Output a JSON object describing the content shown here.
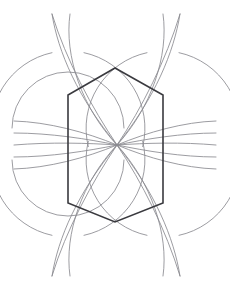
{
  "canvas": {
    "width": 230,
    "height": 290,
    "background": "#ffffff",
    "title": "Hexagon with radiating circular arcs"
  },
  "palette": {
    "hexagon_stroke": "#3a3a3f",
    "arc_stroke": "#8a8a90",
    "arc_stroke_dark": "#76767c",
    "background": "#ffffff"
  },
  "strokes": {
    "hexagon_width": 1.6,
    "arc_width": 0.85
  },
  "geometry": {
    "center": {
      "x": 117,
      "y": 145
    },
    "radius": 66,
    "hexagon": {
      "label": "hexagon",
      "points": "115,68 163,95 163,203 115,222 68,203 68,95",
      "vertices": [
        {
          "name": "top-apex",
          "x": 115,
          "y": 68
        },
        {
          "name": "upper-right",
          "x": 163,
          "y": 95
        },
        {
          "name": "lower-right",
          "x": 163,
          "y": 203
        },
        {
          "name": "bottom-apex",
          "x": 115,
          "y": 222
        },
        {
          "name": "lower-left",
          "x": 68,
          "y": 203
        },
        {
          "name": "upper-left",
          "x": 68,
          "y": 95
        }
      ]
    },
    "nodes": [
      {
        "name": "node-left-upper",
        "x": 68,
        "y": 128
      },
      {
        "name": "node-left-lower",
        "x": 68,
        "y": 160
      },
      {
        "name": "node-right-upper",
        "x": 163,
        "y": 128
      },
      {
        "name": "node-right-lower",
        "x": 163,
        "y": 160
      },
      {
        "name": "node-center",
        "x": 117,
        "y": 145
      }
    ],
    "arc_centers": [
      {
        "name": "arc-center-left-upper",
        "x": 68,
        "y": 128,
        "r": 66
      },
      {
        "name": "arc-center-left-lower",
        "x": 68,
        "y": 160,
        "r": 66
      },
      {
        "name": "arc-center-right-upper",
        "x": 163,
        "y": 128,
        "r": 66
      },
      {
        "name": "arc-center-right-lower",
        "x": 163,
        "y": 160,
        "r": 66
      },
      {
        "name": "arc-center-top",
        "x": 117,
        "y": 78,
        "r": 66
      },
      {
        "name": "arc-center-bottom",
        "x": 117,
        "y": 212,
        "r": 66
      },
      {
        "name": "arc-center-far-left",
        "x": 20,
        "y": 145,
        "r": 98
      },
      {
        "name": "arc-center-far-right",
        "x": 214,
        "y": 145,
        "r": 98
      }
    ],
    "arc_paths": [
      {
        "name": "arc-top-left-long",
        "d": "M 52,14 C 58,52 78,98 117,145"
      },
      {
        "name": "arc-top-right-long",
        "d": "M 180,14 C 174,52 155,98 117,145"
      },
      {
        "name": "arc-bottom-left-long",
        "d": "M 52,276 C 58,238 78,192 117,145"
      },
      {
        "name": "arc-bottom-right-long",
        "d": "M 180,276 C 174,238 155,192 117,145"
      },
      {
        "name": "arc-top-inner-left",
        "d": "M 70,14 C 64,56 82,108 117,145"
      },
      {
        "name": "arc-top-inner-right",
        "d": "M 163,14 C 169,56 151,108 117,145"
      },
      {
        "name": "arc-bottom-inner-left",
        "d": "M 70,276 C 64,234 82,182 117,145"
      },
      {
        "name": "arc-bottom-inner-right",
        "d": "M 163,276 C 169,234 151,182 117,145"
      },
      {
        "name": "arc-left-upper-fan",
        "d": "M 14,121 C 48,122 86,132 117,145"
      },
      {
        "name": "arc-left-lower-fan",
        "d": "M 14,169 C 48,168 86,158 117,145"
      },
      {
        "name": "arc-right-upper-fan",
        "d": "M 216,121 C 184,122 148,132 117,145"
      },
      {
        "name": "arc-right-lower-fan",
        "d": "M 216,169 C 184,168 148,158 117,145"
      },
      {
        "name": "arc-left-flat-upper",
        "d": "M 14,133 C 50,133 88,139 117,145"
      },
      {
        "name": "arc-left-flat-lower",
        "d": "M 14,157 C 50,157 88,151 117,145"
      },
      {
        "name": "arc-right-flat-upper",
        "d": "M 216,133 C 182,133 146,139 117,145"
      },
      {
        "name": "arc-right-flat-lower",
        "d": "M 216,157 C 182,157 146,151 117,145"
      },
      {
        "name": "arc-node-left-upper-circle",
        "d": "M 68,128 m -56,0 a 56,56 0 0 1 112,0"
      },
      {
        "name": "arc-node-left-lower-circle",
        "d": "M 68,160 m -56,0 a 56,56 0 0 0 112,0"
      }
    ]
  },
  "arc_groups": [
    {
      "name": "left-node-upper-arcs",
      "cx": 68,
      "cy": 128,
      "r": 77,
      "segments": [
        {
          "name": "seg-a",
          "start_deg": -78,
          "end_deg": 14
        },
        {
          "name": "seg-b",
          "start_deg": 166,
          "end_deg": 258
        }
      ]
    },
    {
      "name": "left-node-lower-arcs",
      "cx": 68,
      "cy": 160,
      "r": 77,
      "segments": [
        {
          "name": "seg-a",
          "start_deg": -14,
          "end_deg": 78
        },
        {
          "name": "seg-b",
          "start_deg": 102,
          "end_deg": 194
        }
      ]
    },
    {
      "name": "right-node-upper-arcs",
      "cx": 163,
      "cy": 128,
      "r": 77,
      "segments": [
        {
          "name": "seg-a",
          "start_deg": 166,
          "end_deg": 258
        },
        {
          "name": "seg-b",
          "start_deg": -78,
          "end_deg": 14
        }
      ]
    },
    {
      "name": "right-node-lower-arcs",
      "cx": 163,
      "cy": 160,
      "r": 77,
      "segments": [
        {
          "name": "seg-a",
          "start_deg": 102,
          "end_deg": 194
        },
        {
          "name": "seg-b",
          "start_deg": -14,
          "end_deg": 78
        }
      ]
    }
  ]
}
